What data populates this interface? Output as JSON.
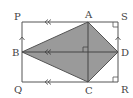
{
  "diagram": {
    "colors": {
      "line": "#555555",
      "fill": "#9a9a9a",
      "label": "#444444",
      "background": "#ffffff"
    },
    "points": {
      "P": {
        "label": "P",
        "x": 22,
        "y": 22
      },
      "A": {
        "label": "A",
        "x": 88,
        "y": 22
      },
      "S": {
        "label": "S",
        "x": 118,
        "y": 22
      },
      "B": {
        "label": "B",
        "x": 22,
        "y": 52
      },
      "D": {
        "label": "D",
        "x": 118,
        "y": 52
      },
      "Q": {
        "label": "Q",
        "x": 22,
        "y": 82
      },
      "C": {
        "label": "C",
        "x": 88,
        "y": 82
      },
      "R": {
        "label": "R",
        "x": 118,
        "y": 82
      }
    },
    "labels": {
      "P": "P",
      "A": "A",
      "S": "S",
      "B": "B",
      "D": "D",
      "Q": "Q",
      "C": "C",
      "R": "R"
    },
    "markers": {
      "parallel_double_arrows": [
        "PS",
        "BD",
        "QR"
      ],
      "parallel_single_arrows": [
        "QP",
        "RS"
      ],
      "right_angles": [
        "S",
        "R",
        "intersection AC-BD"
      ]
    }
  }
}
